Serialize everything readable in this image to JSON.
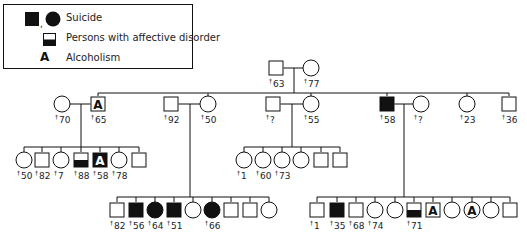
{
  "legend": {
    "items": [
      {
        "symbol": "filled-square-and-circle",
        "label": "Suicide"
      },
      {
        "symbol": "half-filled-square",
        "label": "Persons with affective disorder"
      },
      {
        "symbol": "letter-A",
        "glyph": "A",
        "label": "Alcoholism"
      }
    ]
  },
  "colors": {
    "line": "#111111",
    "fill": "#111111",
    "background": "#ffffff"
  },
  "death_marker": "†",
  "pedigree": {
    "generation_1": [
      {
        "id": "g1m",
        "sex": "male",
        "status": "unaffected",
        "death_age": "63",
        "x": 276,
        "y": 68
      },
      {
        "id": "g1f",
        "sex": "female",
        "status": "unaffected",
        "death_age": "77",
        "x": 311,
        "y": 68
      }
    ],
    "generation_2": [
      {
        "id": "g2a_f",
        "sex": "female",
        "status": "unaffected",
        "death_age": "70",
        "x": 62,
        "y": 104
      },
      {
        "id": "g2a_m",
        "sex": "male",
        "status": "alcoholism",
        "death_age": "65",
        "x": 98,
        "y": 104
      },
      {
        "id": "g2b_m",
        "sex": "male",
        "status": "unaffected",
        "death_age": "92",
        "x": 171,
        "y": 104
      },
      {
        "id": "g2b_f",
        "sex": "female",
        "status": "unaffected",
        "death_age": "50",
        "x": 208,
        "y": 104
      },
      {
        "id": "g2c_m",
        "sex": "male",
        "status": "unaffected",
        "death_age": "?",
        "x": 273,
        "y": 104
      },
      {
        "id": "g2c_f",
        "sex": "female",
        "status": "unaffected",
        "death_age": "55",
        "x": 311,
        "y": 104
      },
      {
        "id": "g2d_m",
        "sex": "male",
        "status": "suicide",
        "death_age": "58",
        "x": 387,
        "y": 104
      },
      {
        "id": "g2d_f",
        "sex": "female",
        "status": "unaffected",
        "death_age": "?",
        "x": 421,
        "y": 104
      },
      {
        "id": "g2e_f",
        "sex": "female",
        "status": "unaffected",
        "death_age": "23",
        "x": 467,
        "y": 104
      },
      {
        "id": "g2f_m",
        "sex": "male",
        "status": "unaffected",
        "death_age": "36",
        "x": 509,
        "y": 104
      }
    ],
    "generation_3_family_a": [
      {
        "sex": "female",
        "status": "unaffected",
        "death_age": "50",
        "x": 24,
        "y": 160
      },
      {
        "sex": "male",
        "status": "unaffected",
        "death_age": "82",
        "x": 42,
        "y": 160
      },
      {
        "sex": "female",
        "status": "unaffected",
        "death_age": "7",
        "x": 61,
        "y": 160
      },
      {
        "sex": "male",
        "status": "affective",
        "death_age": "88",
        "x": 81,
        "y": 160
      },
      {
        "sex": "male",
        "status": "suicide-alcoholism",
        "death_age": "58",
        "x": 100,
        "y": 160
      },
      {
        "sex": "female",
        "status": "unaffected",
        "death_age": "78",
        "x": 119,
        "y": 160
      },
      {
        "sex": "male",
        "status": "unaffected",
        "death_age": "",
        "x": 139,
        "y": 160
      }
    ],
    "generation_3_family_c": [
      {
        "sex": "female",
        "status": "unaffected",
        "death_age": "1",
        "x": 244,
        "y": 160
      },
      {
        "sex": "female",
        "status": "unaffected",
        "death_age": "60",
        "x": 263,
        "y": 160
      },
      {
        "sex": "female",
        "status": "unaffected",
        "death_age": "73",
        "x": 282,
        "y": 160
      },
      {
        "sex": "female",
        "status": "unaffected",
        "death_age": "",
        "x": 301,
        "y": 160
      },
      {
        "sex": "male",
        "status": "unaffected",
        "death_age": "",
        "x": 321,
        "y": 160
      },
      {
        "sex": "male",
        "status": "unaffected",
        "death_age": "",
        "x": 340,
        "y": 160
      }
    ],
    "generation_3_family_b": [
      {
        "sex": "male",
        "status": "unaffected",
        "death_age": "82",
        "x": 117,
        "y": 210
      },
      {
        "sex": "male",
        "status": "suicide",
        "death_age": "56",
        "x": 136,
        "y": 210
      },
      {
        "sex": "female",
        "status": "suicide",
        "death_age": "64",
        "x": 155,
        "y": 210
      },
      {
        "sex": "male",
        "status": "suicide",
        "death_age": "51",
        "x": 174,
        "y": 210
      },
      {
        "sex": "female",
        "status": "unaffected",
        "death_age": "",
        "x": 193,
        "y": 210
      },
      {
        "sex": "female",
        "status": "suicide",
        "death_age": "66",
        "x": 212,
        "y": 210
      },
      {
        "sex": "male",
        "status": "unaffected",
        "death_age": "",
        "x": 231,
        "y": 210
      },
      {
        "sex": "male",
        "status": "unaffected",
        "death_age": "",
        "x": 250,
        "y": 210
      },
      {
        "sex": "female",
        "status": "unaffected",
        "death_age": "",
        "x": 269,
        "y": 210
      }
    ],
    "generation_3_family_d": [
      {
        "sex": "male",
        "status": "unaffected",
        "death_age": "1",
        "x": 317,
        "y": 210
      },
      {
        "sex": "male",
        "status": "suicide",
        "death_age": "35",
        "x": 337,
        "y": 210
      },
      {
        "sex": "male",
        "status": "unaffected",
        "death_age": "68",
        "x": 356,
        "y": 210
      },
      {
        "sex": "female",
        "status": "unaffected",
        "death_age": "74",
        "x": 375,
        "y": 210
      },
      {
        "sex": "female",
        "status": "unaffected",
        "death_age": "",
        "x": 395,
        "y": 210
      },
      {
        "sex": "male",
        "status": "affective",
        "death_age": "71",
        "x": 414,
        "y": 210
      },
      {
        "sex": "male",
        "status": "alcoholism",
        "death_age": "",
        "x": 433,
        "y": 210
      },
      {
        "sex": "female",
        "status": "unaffected",
        "death_age": "",
        "x": 452,
        "y": 210
      },
      {
        "sex": "female",
        "status": "alcoholism",
        "death_age": "",
        "x": 472,
        "y": 210
      },
      {
        "sex": "female",
        "status": "unaffected",
        "death_age": "",
        "x": 491,
        "y": 210
      },
      {
        "sex": "male",
        "status": "unaffected",
        "death_age": "",
        "x": 510,
        "y": 210
      }
    ]
  }
}
